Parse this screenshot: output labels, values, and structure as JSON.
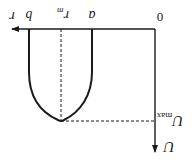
{
  "diagram": {
    "orientation": "rotated 180 degrees",
    "colors": {
      "line": "#1a1a1a",
      "background": "#ffffff"
    },
    "axes": {
      "origin_label": "0",
      "horizontal_axis_label": "r",
      "vertical_axis_label": "U"
    },
    "markers": {
      "inner_radius": "a",
      "outer_radius": "b",
      "peak_position": "r",
      "peak_position_subscript": "m",
      "peak_value": "U",
      "peak_value_subscript": "max"
    },
    "curve": {
      "description": "U-shaped profile between r = a and r = b with extremum U_max at r = r_m",
      "dashed_guides": [
        "vertical at r_m",
        "horizontal at U_max"
      ]
    }
  }
}
